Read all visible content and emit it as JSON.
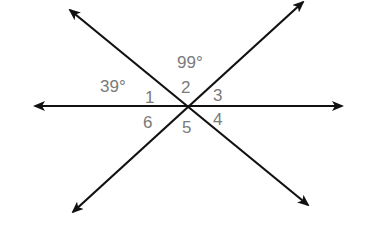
{
  "diagram": {
    "type": "intersecting-lines-angles",
    "intersection": {
      "x": 189,
      "y": 106
    },
    "lines": [
      {
        "name": "horizontal",
        "from": [
          35,
          106
        ],
        "to": [
          342,
          106
        ]
      },
      {
        "name": "descending",
        "from": [
          70,
          10
        ],
        "to": [
          308,
          205
        ]
      },
      {
        "name": "ascending",
        "from": [
          303,
          2
        ],
        "to": [
          73,
          212
        ]
      }
    ],
    "angle_measures": [
      {
        "label": "39°",
        "x": 100,
        "y": 78
      },
      {
        "label": "99°",
        "x": 177,
        "y": 54
      }
    ],
    "angle_numbers": [
      {
        "label": "1",
        "x": 145,
        "y": 89
      },
      {
        "label": "2",
        "x": 181,
        "y": 79
      },
      {
        "label": "3",
        "x": 213,
        "y": 87
      },
      {
        "label": "4",
        "x": 213,
        "y": 111
      },
      {
        "label": "5",
        "x": 182,
        "y": 119
      },
      {
        "label": "6",
        "x": 143,
        "y": 114
      }
    ],
    "line_color": "#111111",
    "label_color": "#7a7a7a"
  }
}
